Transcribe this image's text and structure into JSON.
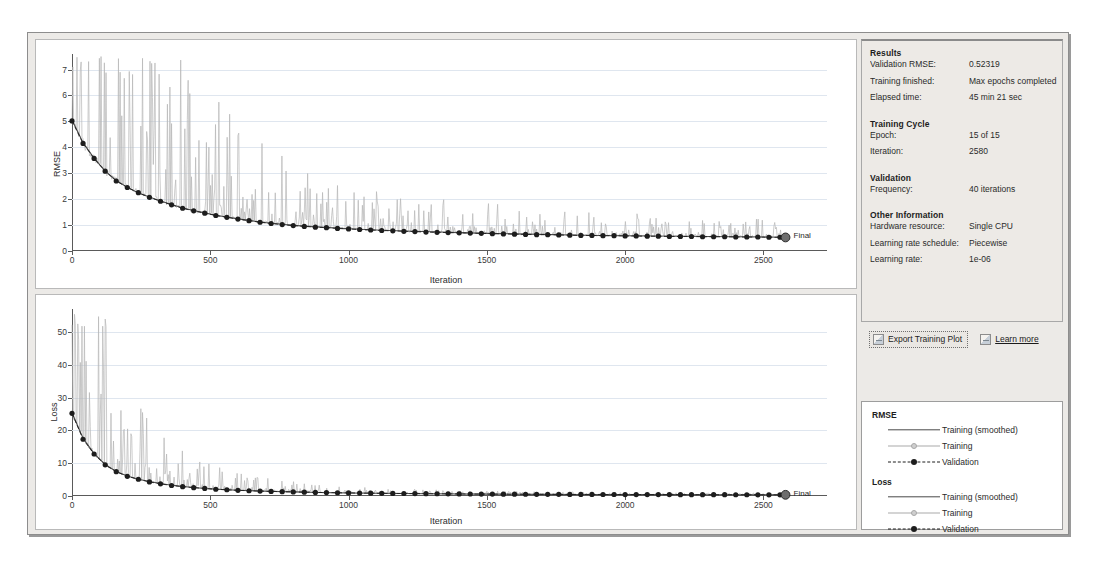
{
  "window": {
    "title": "Training Progress"
  },
  "results": {
    "heading": "Results",
    "rows": [
      {
        "key": "Validation RMSE:",
        "value": "0.52319"
      },
      {
        "key": "Training finished:",
        "value": "Max epochs completed"
      },
      {
        "key": "Elapsed time:",
        "value": "45 min 21 sec"
      }
    ]
  },
  "training_cycle": {
    "heading": "Training Cycle",
    "rows": [
      {
        "key": "Epoch:",
        "value": "15 of 15"
      },
      {
        "key": "Iteration:",
        "value": "2580"
      }
    ]
  },
  "validation": {
    "heading": "Validation",
    "rows": [
      {
        "key": "Frequency:",
        "value": "40 iterations"
      }
    ]
  },
  "other_information": {
    "heading": "Other Information",
    "rows": [
      {
        "key": "Hardware resource:",
        "value": "Single CPU"
      },
      {
        "key": "Learning rate schedule:",
        "value": "Piecewise"
      },
      {
        "key": "Learning rate:",
        "value": "1e-06"
      }
    ]
  },
  "actions": {
    "export_label": "Export Training Plot",
    "export_icon": "export-plot-icon",
    "learn_more_label": "Learn more",
    "learn_more_icon": "help-book-icon"
  },
  "legend": {
    "groups": [
      {
        "title": "RMSE",
        "entries": [
          {
            "label": "Training (smoothed)",
            "style": "solid-dark",
            "color": "#4a4a4a"
          },
          {
            "label": "Training",
            "style": "solid-light",
            "color": "#a9a9a9"
          },
          {
            "label": "Validation",
            "style": "dashed-dot",
            "color": "#1d1d1d"
          }
        ]
      },
      {
        "title": "Loss",
        "entries": [
          {
            "label": "Training (smoothed)",
            "style": "solid-dark",
            "color": "#4a4a4a"
          },
          {
            "label": "Training",
            "style": "solid-light",
            "color": "#a9a9a9"
          },
          {
            "label": "Validation",
            "style": "dashed-dot",
            "color": "#1d1d1d"
          }
        ]
      }
    ]
  },
  "final_marker": {
    "label": "Final"
  },
  "chart_data": [
    {
      "id": "rmse",
      "type": "line",
      "title": "",
      "xlabel": "Iteration",
      "ylabel": "RMSE",
      "xlim": [
        0,
        2730
      ],
      "ylim": [
        0,
        7.6
      ],
      "xticks": [
        0,
        500,
        1000,
        1500,
        2000,
        2500
      ],
      "yticks": [
        0,
        1,
        2,
        3,
        4,
        5,
        6,
        7
      ],
      "grid": true,
      "series": [
        {
          "name": "Training (smoothed)",
          "style": "solid-dark",
          "color": "#4a4a4a",
          "x": [
            0,
            40,
            80,
            120,
            160,
            200,
            240,
            280,
            320,
            360,
            400,
            440,
            480,
            520,
            560,
            600,
            640,
            680,
            720,
            760,
            800,
            900,
            1000,
            1100,
            1200,
            1300,
            1400,
            1500,
            1600,
            1700,
            1800,
            1900,
            2000,
            2100,
            2200,
            2300,
            2400,
            2500,
            2580
          ],
          "values": [
            5.05,
            4.18,
            3.58,
            3.08,
            2.72,
            2.46,
            2.24,
            2.08,
            1.93,
            1.79,
            1.66,
            1.56,
            1.47,
            1.38,
            1.31,
            1.24,
            1.18,
            1.12,
            1.07,
            1.03,
            0.99,
            0.92,
            0.86,
            0.81,
            0.77,
            0.74,
            0.71,
            0.68,
            0.66,
            0.64,
            0.62,
            0.6,
            0.59,
            0.58,
            0.57,
            0.56,
            0.55,
            0.54,
            0.53
          ]
        },
        {
          "name": "Training",
          "style": "solid-light",
          "color": "#b6b6b6",
          "note": "noisy per-iteration RMSE with upward spikes; envelope max ~7.3 early decaying to ~1.2 late, min follows smoothed curve"
        },
        {
          "name": "Validation",
          "style": "dashed-dot",
          "color": "#1d1d1d",
          "x": [
            0,
            40,
            80,
            120,
            160,
            200,
            240,
            280,
            320,
            360,
            400,
            440,
            480,
            520,
            560,
            600,
            640,
            680,
            720,
            760,
            800,
            840,
            880,
            920,
            960,
            1000,
            1040,
            1080,
            1120,
            1160,
            1200,
            1240,
            1280,
            1320,
            1360,
            1400,
            1440,
            1480,
            1520,
            1560,
            1600,
            1640,
            1680,
            1720,
            1760,
            1800,
            1840,
            1880,
            1920,
            1960,
            2000,
            2040,
            2080,
            2120,
            2160,
            2200,
            2240,
            2280,
            2320,
            2360,
            2400,
            2440,
            2480,
            2520,
            2560,
            2580
          ],
          "values": [
            5.02,
            4.15,
            3.57,
            3.08,
            2.7,
            2.45,
            2.25,
            2.07,
            1.92,
            1.78,
            1.65,
            1.55,
            1.46,
            1.37,
            1.3,
            1.23,
            1.17,
            1.11,
            1.06,
            1.02,
            0.98,
            0.95,
            0.92,
            0.9,
            0.87,
            0.85,
            0.83,
            0.81,
            0.79,
            0.78,
            0.76,
            0.75,
            0.73,
            0.72,
            0.71,
            0.7,
            0.69,
            0.68,
            0.67,
            0.66,
            0.65,
            0.64,
            0.63,
            0.63,
            0.62,
            0.61,
            0.6,
            0.6,
            0.59,
            0.59,
            0.58,
            0.58,
            0.57,
            0.57,
            0.56,
            0.56,
            0.56,
            0.55,
            0.55,
            0.55,
            0.54,
            0.54,
            0.54,
            0.53,
            0.53,
            0.52319
          ]
        }
      ],
      "annotations": [
        {
          "text": "Final",
          "x": 2580,
          "y": 0.52319
        }
      ]
    },
    {
      "id": "loss",
      "type": "line",
      "title": "",
      "xlabel": "Iteration",
      "ylabel": "Loss",
      "xlim": [
        0,
        2730
      ],
      "ylim": [
        0,
        57
      ],
      "xticks": [
        0,
        500,
        1000,
        1500,
        2000,
        2500
      ],
      "yticks": [
        0,
        10,
        20,
        30,
        40,
        50
      ],
      "grid": true,
      "series": [
        {
          "name": "Training (smoothed)",
          "style": "solid-dark",
          "color": "#4a4a4a",
          "x": [
            0,
            40,
            80,
            120,
            160,
            200,
            240,
            280,
            320,
            360,
            400,
            440,
            480,
            520,
            560,
            600,
            700,
            800,
            900,
            1000,
            1100,
            1200,
            1300,
            1400,
            1500,
            1600,
            1700,
            1800,
            1900,
            2000,
            2100,
            2200,
            2300,
            2400,
            2500,
            2580
          ],
          "values": [
            25.4,
            17.6,
            12.9,
            9.6,
            7.5,
            6.1,
            5.1,
            4.4,
            3.8,
            3.3,
            2.9,
            2.6,
            2.3,
            2.1,
            1.9,
            1.75,
            1.45,
            1.25,
            1.05,
            0.92,
            0.82,
            0.74,
            0.68,
            0.62,
            0.58,
            0.54,
            0.51,
            0.48,
            0.46,
            0.44,
            0.42,
            0.41,
            0.39,
            0.38,
            0.37,
            0.36
          ]
        },
        {
          "name": "Training",
          "style": "solid-light",
          "color": "#b6b6b6",
          "note": "noisy per-iteration loss with large upward spikes; envelope max ~53 early decaying to ~4 late"
        },
        {
          "name": "Validation",
          "style": "dashed-dot",
          "color": "#1d1d1d",
          "x": [
            0,
            40,
            80,
            120,
            160,
            200,
            240,
            280,
            320,
            360,
            400,
            440,
            480,
            520,
            560,
            600,
            640,
            680,
            720,
            760,
            800,
            840,
            880,
            920,
            960,
            1000,
            1040,
            1080,
            1120,
            1160,
            1200,
            1240,
            1280,
            1320,
            1360,
            1400,
            1440,
            1480,
            1520,
            1560,
            1600,
            1640,
            1680,
            1720,
            1760,
            1800,
            1840,
            1880,
            1920,
            1960,
            2000,
            2040,
            2080,
            2120,
            2160,
            2200,
            2240,
            2280,
            2320,
            2360,
            2400,
            2440,
            2480,
            2520,
            2560,
            2580
          ],
          "values": [
            25.2,
            17.3,
            12.8,
            9.5,
            7.4,
            6.0,
            5.1,
            4.3,
            3.7,
            3.2,
            2.85,
            2.55,
            2.3,
            2.05,
            1.9,
            1.72,
            1.6,
            1.5,
            1.4,
            1.32,
            1.24,
            1.17,
            1.1,
            1.05,
            0.99,
            0.94,
            0.9,
            0.86,
            0.82,
            0.79,
            0.76,
            0.73,
            0.7,
            0.68,
            0.65,
            0.63,
            0.61,
            0.59,
            0.58,
            0.56,
            0.55,
            0.53,
            0.52,
            0.51,
            0.5,
            0.49,
            0.48,
            0.47,
            0.46,
            0.45,
            0.44,
            0.44,
            0.43,
            0.42,
            0.42,
            0.41,
            0.4,
            0.4,
            0.39,
            0.39,
            0.38,
            0.38,
            0.37,
            0.37,
            0.36,
            0.36
          ]
        }
      ],
      "annotations": [
        {
          "text": "Final",
          "x": 2580,
          "y": 0.36
        }
      ]
    }
  ]
}
